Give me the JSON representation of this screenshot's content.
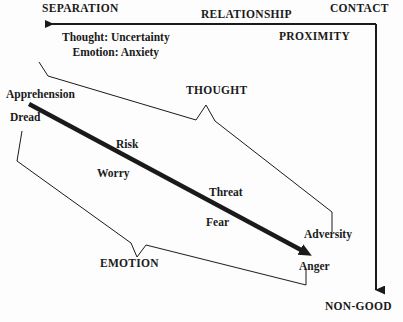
{
  "diagram": {
    "background_color": "#fdfdfd",
    "line_color": "#1a1a1a",
    "text_color": "#1a1a1a",
    "axis_labels": {
      "separation": "SEPARATION",
      "relationship": "RELATIONSHIP",
      "contact": "CONTACT",
      "proximity": "PROXIMITY",
      "non_good": "NON-GOOD"
    },
    "note": {
      "line1": "Thought: Uncertainty",
      "line2": "Emotion: Anxiety"
    },
    "brackets": {
      "thought": "THOUGHT",
      "emotion": "EMOTION"
    },
    "scale_items": [
      {
        "label": "Apprehension"
      },
      {
        "label": "Dread"
      },
      {
        "label": "Risk"
      },
      {
        "label": "Worry"
      },
      {
        "label": "Threat"
      },
      {
        "label": "Fear"
      },
      {
        "label": "Adversity"
      },
      {
        "label": "Anger"
      }
    ]
  }
}
